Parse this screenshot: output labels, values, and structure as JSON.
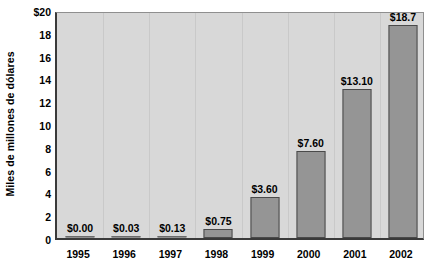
{
  "chart_data": {
    "type": "bar",
    "title": "",
    "subtitle": "",
    "xlabel": "",
    "ylabel": "Miles de millones de dólares",
    "categories": [
      "1995",
      "1996",
      "1997",
      "1998",
      "1999",
      "2000",
      "2001",
      "2002"
    ],
    "values": [
      0.0,
      0.03,
      0.13,
      0.75,
      3.6,
      7.6,
      13.1,
      18.7
    ],
    "data_labels": [
      "$0.00",
      "$0.03",
      "$0.13",
      "$0.75",
      "$3.60",
      "$7.60",
      "$13.10",
      "$18.7"
    ],
    "ylim": [
      0,
      20
    ],
    "ytick_values": [
      0,
      2,
      4,
      6,
      8,
      10,
      12,
      14,
      16,
      18,
      20
    ],
    "ytick_labels": [
      "0",
      "2",
      "4",
      "6",
      "8",
      "10",
      "12",
      "14",
      "16",
      "18",
      "$20"
    ],
    "grid": "vertical-only",
    "legend": "none",
    "colors": {
      "bar_fill": "#959595",
      "bar_border": "#4a4a4a",
      "plot_background": "#d8d8d8",
      "gridline": "#c9c9c9",
      "axis": "#3a3a3a",
      "text": "#000000",
      "page_background": "#ffffff"
    }
  }
}
